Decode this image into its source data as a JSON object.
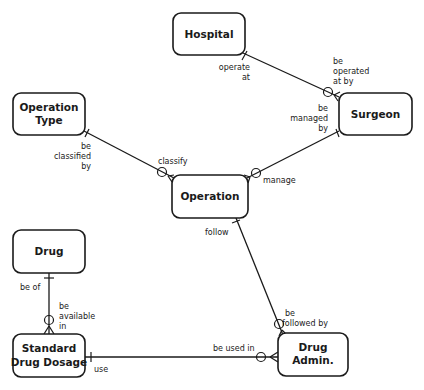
{
  "diagram": {
    "type": "entity-relationship",
    "entities": [
      {
        "id": "hospital",
        "lines": [
          "Hospital"
        ]
      },
      {
        "id": "surgeon",
        "lines": [
          "Surgeon"
        ]
      },
      {
        "id": "operation_type",
        "lines": [
          "Operation",
          "Type"
        ]
      },
      {
        "id": "operation",
        "lines": [
          "Operation"
        ]
      },
      {
        "id": "drug",
        "lines": [
          "Drug"
        ]
      },
      {
        "id": "standard_drug_dosage",
        "lines": [
          "Standard",
          "Drug Dosage"
        ]
      },
      {
        "id": "drug_admin",
        "lines": [
          "Drug",
          "Admin."
        ]
      }
    ],
    "relationships": [
      {
        "from": "hospital",
        "to": "surgeon",
        "from_label": [
          "operate",
          "at"
        ],
        "to_label": [
          "be",
          "operated",
          "at by"
        ],
        "from_cardinality": "one",
        "to_cardinality": "zero-or-many"
      },
      {
        "from": "surgeon",
        "to": "operation",
        "from_label": [
          "be",
          "managed",
          "by"
        ],
        "to_label": [
          "manage"
        ],
        "from_cardinality": "one",
        "to_cardinality": "zero-or-many"
      },
      {
        "from": "operation_type",
        "to": "operation",
        "from_label": [
          "be",
          "classified",
          "by"
        ],
        "to_label": [
          "classify"
        ],
        "from_cardinality": "one",
        "to_cardinality": "zero-or-many"
      },
      {
        "from": "operation",
        "to": "drug_admin",
        "from_label": [
          "follow"
        ],
        "to_label": [
          "be",
          "followed by"
        ],
        "from_cardinality": "one",
        "to_cardinality": "zero-or-many"
      },
      {
        "from": "drug",
        "to": "standard_drug_dosage",
        "from_label": [
          "be of"
        ],
        "to_label": [
          "be",
          "available",
          "in"
        ],
        "from_cardinality": "one",
        "to_cardinality": "zero-or-many"
      },
      {
        "from": "standard_drug_dosage",
        "to": "drug_admin",
        "from_label": [
          "use"
        ],
        "to_label": [
          "be used in"
        ],
        "from_cardinality": "one",
        "to_cardinality": "zero-or-many"
      }
    ]
  },
  "labels": {
    "hospital": {
      "l1": "Hospital"
    },
    "surgeon": {
      "l1": "Surgeon"
    },
    "operation_type": {
      "l1": "Operation",
      "l2": "Type"
    },
    "operation": {
      "l1": "Operation"
    },
    "drug": {
      "l1": "Drug"
    },
    "standard_drug_dosage": {
      "l1": "Standard",
      "l2": "Drug Dosage"
    },
    "drug_admin": {
      "l1": "Drug",
      "l2": "Admin."
    },
    "roles": {
      "operate_at": {
        "l1": "operate",
        "l2": "at"
      },
      "be_operated_at_by": {
        "l1": "be",
        "l2": "operated",
        "l3": "at by"
      },
      "be_managed_by": {
        "l1": "be",
        "l2": "managed",
        "l3": "by"
      },
      "manage": {
        "l1": "manage"
      },
      "be_classified_by": {
        "l1": "be",
        "l2": "classified",
        "l3": "by"
      },
      "classify": {
        "l1": "classify"
      },
      "follow": {
        "l1": "follow"
      },
      "be_followed_by": {
        "l1": "be",
        "l2": "followed by"
      },
      "be_of": {
        "l1": "be of"
      },
      "be_available_in": {
        "l1": "be",
        "l2": "available",
        "l3": "in"
      },
      "use": {
        "l1": "use"
      },
      "be_used_in": {
        "l1": "be used in"
      }
    }
  },
  "colors": {
    "stroke": "#1a1a1a",
    "background": "#ffffff"
  }
}
